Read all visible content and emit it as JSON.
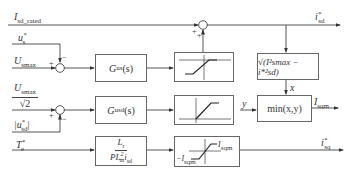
{
  "diagram": {
    "inputs": {
      "isd_rated": "I",
      "isd_rated_sub": "sd_rated",
      "us_star": "u",
      "us_star_sub": "s",
      "us_star_sup": "*",
      "usmax": "U",
      "usmax_sub": "smax",
      "usmax_frac_num": "U",
      "usmax_frac_num_sub": "smax",
      "usmax_frac_den": "√2",
      "usd_abs": "|u",
      "usd_abs_sub": "sd",
      "usd_abs_sup": "*",
      "usd_abs_close": "|",
      "te_star": "T",
      "te_star_sub": "e",
      "te_star_sup": "*"
    },
    "blocks": {
      "gus": {
        "main": "G",
        "sub": "us",
        "tail": "(s)"
      },
      "gusd": {
        "main": "G",
        "sub": "usd",
        "tail": "(s)"
      },
      "sqrt": {
        "label": "√(I²smax − i*²sd)"
      },
      "min": {
        "label": "min(x,y)"
      },
      "torque_gain": {
        "num": "L",
        "num_sub": "r",
        "den": "PL",
        "den_sub": "m",
        "den_sup": "2",
        "den_tail": "i",
        "den_tail_sub": "sd",
        "den_tail_sup": "*"
      },
      "limiter_neg": {
        "label": "−I",
        "sub": "sqm"
      },
      "limiter_pos": {
        "label": "I",
        "sub": "sqm"
      }
    },
    "signals": {
      "x": "x",
      "y": "y",
      "isqm": "I",
      "isqm_sub": "sqm",
      "isd_out": "i",
      "isd_out_sub": "sd",
      "isd_out_sup": "*",
      "isq_out": "i",
      "isq_out_sub": "sq",
      "isq_out_sup": "*"
    },
    "signs": {
      "plus": "+",
      "minus": "−"
    }
  }
}
